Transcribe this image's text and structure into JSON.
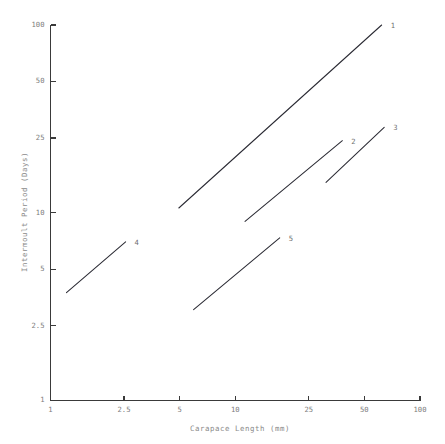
{
  "chart_data": {
    "type": "line",
    "title": "",
    "xlabel": "Carapace Length (mm)",
    "ylabel": "Intermoult Period (Days)",
    "xscale": "log",
    "yscale": "log",
    "xlim": [
      1,
      100
    ],
    "ylim": [
      1,
      100
    ],
    "grid": false,
    "legend": "inline-end-labels",
    "xticks": [
      1,
      2.5,
      5,
      10,
      25,
      50,
      100
    ],
    "xticklabels": [
      "1",
      "2.5",
      "5",
      "10",
      "25",
      "50",
      "100"
    ],
    "yticks": [
      1,
      2.5,
      5,
      10,
      25,
      50,
      100
    ],
    "yticklabels": [
      "1",
      "2.5",
      "5",
      "10",
      "25",
      "50",
      "100"
    ],
    "series": [
      {
        "name": "1",
        "label": "1",
        "x": [
          4.95,
          62.0
        ],
        "y": [
          10.6,
          100.0
        ]
      },
      {
        "name": "2",
        "label": "2",
        "x": [
          11.3,
          38.0
        ],
        "y": [
          9.0,
          24.2
        ]
      },
      {
        "name": "3",
        "label": "3",
        "x": [
          31.0,
          64.0
        ],
        "y": [
          14.5,
          28.5
        ]
      },
      {
        "name": "4",
        "label": "4",
        "x": [
          1.22,
          2.55
        ],
        "y": [
          3.75,
          7.0
        ]
      },
      {
        "name": "5",
        "label": "5",
        "x": [
          5.95,
          17.4
        ],
        "y": [
          3.05,
          7.35
        ]
      }
    ]
  }
}
